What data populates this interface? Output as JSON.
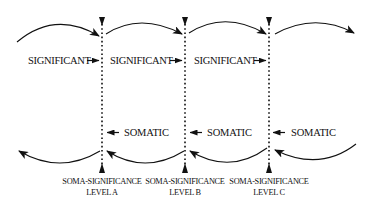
{
  "diagram": {
    "type": "process-flow",
    "colors": {
      "ink": "#111111",
      "background": "#ffffff"
    },
    "levels": [
      {
        "line1": "SOMA-SIGNIFICANCE",
        "line2": "LEVEL A"
      },
      {
        "line1": "SOMA-SIGNIFICANCE",
        "line2": "LEVEL B"
      },
      {
        "line1": "SOMA-SIGNIFICANCE",
        "line2": "LEVEL C"
      }
    ],
    "significant_labels": [
      "SIGNIFICANT",
      "SIGNIFICANT",
      "SIGNIFICANT"
    ],
    "somatic_labels": [
      "SOMATIC",
      "SOMATIC",
      "SOMATIC"
    ],
    "arrows": {
      "top_arcs_direction": "left-to-right",
      "bottom_arcs_direction": "right-to-left",
      "significant_arrow_glyph": "arrow-right",
      "somatic_arrow_glyph": "arrow-left"
    }
  }
}
